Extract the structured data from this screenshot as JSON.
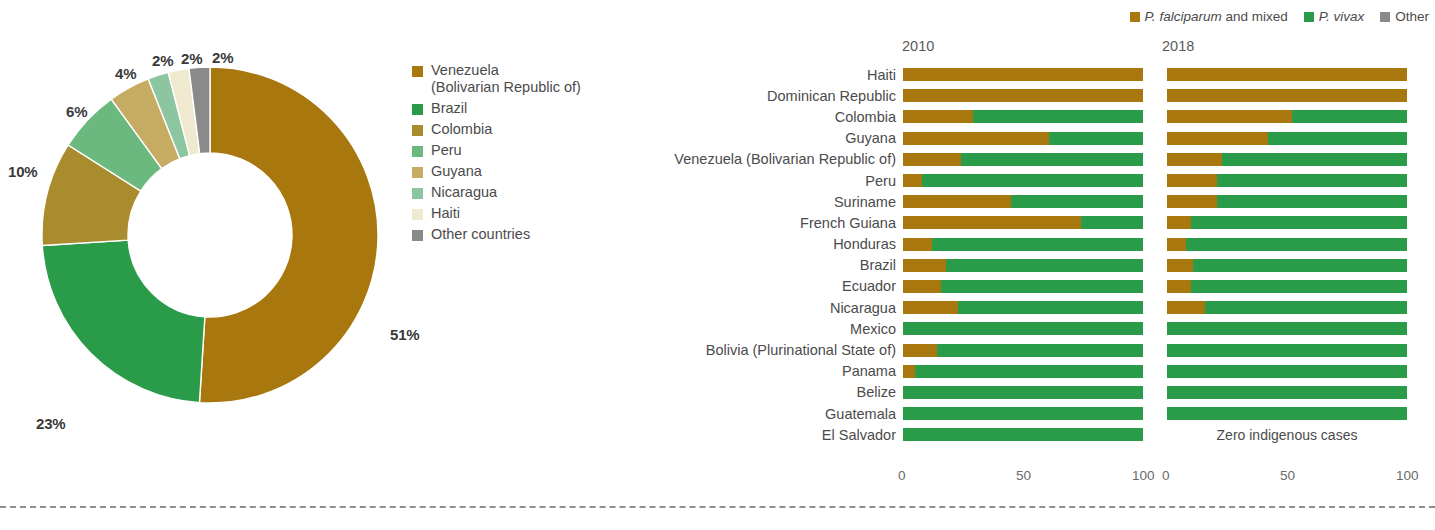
{
  "colors": {
    "venezuela": "#a8780f",
    "brazil": "#2a9b48",
    "colombia": "#a98c2e",
    "peru": "#6cb97f",
    "guyana": "#c6ab63",
    "nicaragua": "#8cc6a0",
    "haiti": "#efe9cf",
    "other": "#8a8a8a",
    "falciparum": "#a8780f",
    "vivax": "#2a9b48",
    "other_series": "#8a8a8a",
    "text": "#4b4b4b",
    "dashed_rule": "#8e8e8e"
  },
  "donut": {
    "legend_title": "",
    "legend": [
      {
        "label": "Venezuela (Bolivarian Republic of)",
        "line1": "Venezuela",
        "line2": "(Bolivarian Republic of)",
        "color_key": "venezuela"
      },
      {
        "label": "Brazil",
        "line1": "Brazil",
        "line2": "",
        "color_key": "brazil"
      },
      {
        "label": "Colombia",
        "line1": "Colombia",
        "line2": "",
        "color_key": "colombia"
      },
      {
        "label": "Peru",
        "line1": "Peru",
        "line2": "",
        "color_key": "peru"
      },
      {
        "label": "Guyana",
        "line1": "Guyana",
        "line2": "",
        "color_key": "guyana"
      },
      {
        "label": "Nicaragua",
        "line1": "Nicaragua",
        "line2": "",
        "color_key": "nicaragua"
      },
      {
        "label": "Haiti",
        "line1": "Haiti",
        "line2": "",
        "color_key": "haiti"
      },
      {
        "label": "Other countries",
        "line1": "Other countries",
        "line2": "",
        "color_key": "other"
      }
    ],
    "labels": {
      "venezuela": "51%",
      "brazil": "23%",
      "colombia": "10%",
      "peru": "6%",
      "guyana": "4%",
      "nicaragua": "2%",
      "haiti": "2%",
      "other": "2%"
    }
  },
  "bars": {
    "series_legend": [
      {
        "label_italic": "P. falciparum",
        "label_rest": " and mixed",
        "color_key": "falciparum"
      },
      {
        "label_italic": "P. vivax",
        "label_rest": "",
        "color_key": "vivax"
      },
      {
        "label_italic": "",
        "label_rest": "Other",
        "color_key": "other_series"
      }
    ],
    "panel_headers": {
      "left": "2010",
      "right": "2018"
    },
    "axis_ticks": [
      "0",
      "50",
      "100"
    ],
    "zero_note": "Zero indigenous cases",
    "countries": [
      "Haiti",
      "Dominican Republic",
      "Colombia",
      "Guyana",
      "Venezuela (Bolivarian Republic of)",
      "Peru",
      "Suriname",
      "French Guiana",
      "Honduras",
      "Brazil",
      "Ecuador",
      "Nicaragua",
      "Mexico",
      "Bolivia (Plurinational State of)",
      "Panama",
      "Belize",
      "Guatemala",
      "El Salvador"
    ]
  },
  "chart_data": [
    {
      "type": "pie",
      "title": "",
      "subtype": "donut",
      "categories": [
        "Venezuela (Bolivarian Republic of)",
        "Brazil",
        "Colombia",
        "Peru",
        "Guyana",
        "Nicaragua",
        "Haiti",
        "Other countries"
      ],
      "values": [
        51,
        23,
        10,
        6,
        4,
        2,
        2,
        2
      ],
      "value_labels": [
        "51%",
        "23%",
        "10%",
        "6%",
        "4%",
        "2%",
        "2%",
        "2%"
      ],
      "colors": [
        "#a8780f",
        "#2a9b48",
        "#a98c2e",
        "#6cb97f",
        "#c6ab63",
        "#8cc6a0",
        "#efe9cf",
        "#8a8a8a"
      ],
      "legend_position": "right",
      "grid": false,
      "start_angle_deg": 0,
      "direction": "clockwise"
    },
    {
      "type": "bar",
      "subtype": "stacked-horizontal-100",
      "title": "2010",
      "xlabel": "",
      "ylabel": "",
      "xlim": [
        0,
        100
      ],
      "xticks": [
        0,
        50,
        100
      ],
      "grid": false,
      "legend_position": "top-right",
      "categories": [
        "Haiti",
        "Dominican Republic",
        "Colombia",
        "Guyana",
        "Venezuela (Bolivarian Republic of)",
        "Peru",
        "Suriname",
        "French Guiana",
        "Honduras",
        "Brazil",
        "Ecuador",
        "Nicaragua",
        "Mexico",
        "Bolivia (Plurinational State of)",
        "Panama",
        "Belize",
        "Guatemala",
        "El Salvador"
      ],
      "series": [
        {
          "name": "P. falciparum and mixed",
          "color": "#a8780f",
          "values": [
            100,
            100,
            29,
            61,
            24,
            8,
            45,
            74,
            12,
            18,
            16,
            23,
            0,
            14,
            5,
            0,
            0,
            0
          ]
        },
        {
          "name": "P. vivax",
          "color": "#2a9b48",
          "values": [
            0,
            0,
            71,
            39,
            76,
            92,
            55,
            26,
            88,
            82,
            84,
            77,
            100,
            86,
            95,
            100,
            100,
            100
          ]
        },
        {
          "name": "Other",
          "color": "#8a8a8a",
          "values": [
            0,
            0,
            0,
            0,
            0,
            0,
            0,
            0,
            0,
            0,
            0,
            0,
            0,
            0,
            0,
            0,
            0,
            0
          ]
        }
      ]
    },
    {
      "type": "bar",
      "subtype": "stacked-horizontal-100",
      "title": "2018",
      "xlabel": "",
      "ylabel": "",
      "xlim": [
        0,
        100
      ],
      "xticks": [
        0,
        50,
        100
      ],
      "grid": false,
      "legend_position": "top-right",
      "note": "Zero indigenous cases",
      "categories": [
        "Haiti",
        "Dominican Republic",
        "Colombia",
        "Guyana",
        "Venezuela (Bolivarian Republic of)",
        "Peru",
        "Suriname",
        "French Guiana",
        "Honduras",
        "Brazil",
        "Ecuador",
        "Nicaragua",
        "Mexico",
        "Bolivia (Plurinational State of)",
        "Panama",
        "Belize",
        "Guatemala",
        "El Salvador"
      ],
      "series": [
        {
          "name": "P. falciparum and mixed",
          "color": "#a8780f",
          "values": [
            100,
            100,
            52,
            42,
            23,
            21,
            21,
            10,
            8,
            11,
            10,
            16,
            0,
            0,
            0,
            0,
            0,
            null
          ]
        },
        {
          "name": "P. vivax",
          "color": "#2a9b48",
          "values": [
            0,
            0,
            48,
            58,
            77,
            79,
            79,
            90,
            92,
            89,
            90,
            84,
            100,
            100,
            100,
            100,
            100,
            null
          ]
        },
        {
          "name": "Other",
          "color": "#8a8a8a",
          "values": [
            0,
            0,
            0,
            0,
            0,
            0,
            0,
            0,
            0,
            0,
            0,
            0,
            0,
            0,
            0,
            0,
            0,
            null
          ]
        }
      ]
    }
  ]
}
